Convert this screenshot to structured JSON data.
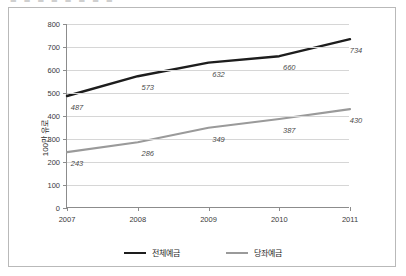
{
  "top_clipped_text": "■ ■ ■ ■  ■ ■ ■ ■",
  "legend": {
    "position": "bottom-center",
    "entries": [
      {
        "label": "전체예금",
        "color": "#1d1d1d",
        "swatch": "line-swatch-dark"
      },
      {
        "label": "당좌예금",
        "color": "#9a9a9a",
        "swatch": "line-swatch-gray"
      }
    ]
  },
  "axis": {
    "y_title": "100만 유로",
    "y_ticks": [
      "800",
      "700",
      "600",
      "500",
      "400",
      "300",
      "200",
      "100",
      "0"
    ],
    "x_ticks": [
      "2007",
      "2008",
      "2009",
      "2010",
      "2011"
    ]
  },
  "chart_data": {
    "type": "line",
    "title": "",
    "xlabel": "",
    "ylabel": "100만 유로",
    "categories": [
      "2007",
      "2008",
      "2009",
      "2010",
      "2011"
    ],
    "ylim": [
      0,
      800
    ],
    "ytick_step": 100,
    "grid": true,
    "legend_position": "bottom-center",
    "series": [
      {
        "name": "전체예금",
        "color": "#1d1d1d",
        "values": [
          487,
          573,
          632,
          660,
          734
        ],
        "labels": [
          "487",
          "573",
          "632",
          "660",
          "734"
        ]
      },
      {
        "name": "당좌예금",
        "color": "#9a9a9a",
        "values": [
          243,
          286,
          349,
          387,
          430
        ],
        "labels": [
          "243",
          "286",
          "349",
          "387",
          "430"
        ]
      }
    ]
  }
}
